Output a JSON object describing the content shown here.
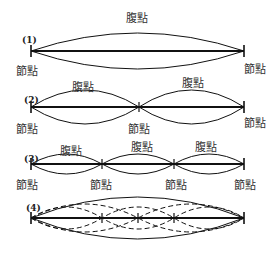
{
  "labels": {
    "antinode": "腹點",
    "node": "節點"
  },
  "diagrams": [
    {
      "id": "(1)",
      "mode": 1,
      "nodes": [
        "節點",
        "節點"
      ],
      "antinodes": [
        "腹點"
      ]
    },
    {
      "id": "(2)",
      "mode": 2,
      "nodes": [
        "節點",
        "節點",
        "節點"
      ],
      "antinodes": [
        "腹點",
        "腹點"
      ]
    },
    {
      "id": "(3)",
      "mode": 3,
      "nodes": [
        "節點",
        "節點",
        "節點",
        "節點"
      ],
      "antinodes": [
        "腹點",
        "腹點",
        "腹點"
      ]
    },
    {
      "id": "(4)",
      "modes_overlaid": [
        1,
        2,
        3,
        4
      ],
      "nodes": [],
      "antinodes": []
    }
  ],
  "colors": {
    "line": "#111111",
    "text": "#333333"
  }
}
